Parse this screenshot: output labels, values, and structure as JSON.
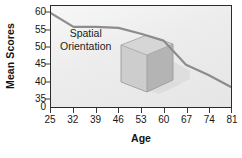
{
  "chart_data": {
    "type": "line",
    "title": "",
    "subtitle": "",
    "xlabel": "Age",
    "ylabel": "Mean Scores",
    "x": [
      25,
      32,
      39,
      46,
      53,
      60,
      67,
      74,
      81
    ],
    "xtick_labels": [
      "25",
      "32",
      "39",
      "46",
      "53",
      "60",
      "67",
      "74",
      "81"
    ],
    "ytick_labels": [
      "0",
      "35",
      "40",
      "45",
      "50",
      "55",
      "60"
    ],
    "ytick_values": [
      0,
      35,
      40,
      45,
      50,
      55,
      60
    ],
    "y_axis_break": true,
    "ylim": [
      33,
      61.5
    ],
    "xlim": [
      25,
      81
    ],
    "grid": false,
    "legend": null,
    "series": [
      {
        "name": "Spatial Orientation",
        "values": [
          60.0,
          56.0,
          56.0,
          55.7,
          54.0,
          52.0,
          45.0,
          42.0,
          38.5
        ],
        "color": "#8c8c8c",
        "line_width": 2.2
      }
    ],
    "annotations": [
      {
        "name": "series-label",
        "line1": "Spatial",
        "line2": "Orientation",
        "text": "Spatial Orientation"
      }
    ],
    "decorations": [
      {
        "name": "open-box-3d",
        "description": "Grey three-dimensional open-top box with cast shadow"
      }
    ],
    "colors": {
      "plot_background": "#efefef",
      "frame": "#2b2b2b",
      "line": "#8c8c8c",
      "box_front": "#c9c9c9",
      "box_side": "#b0b0b0",
      "box_inner": "#d9d9d9",
      "box_rim": "#9a9a9a",
      "shadow": "#d2d2d2",
      "text": "#161616",
      "page_background": "#ffffff"
    }
  }
}
